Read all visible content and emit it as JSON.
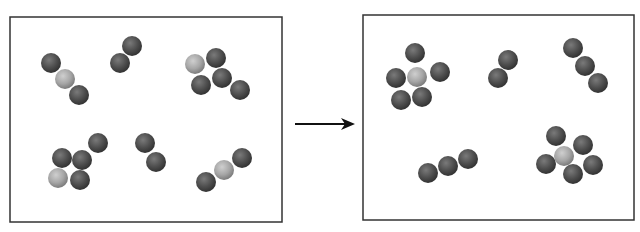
{
  "diagram": {
    "colors": {
      "background": "#ffffff",
      "border": "#333333",
      "dark_atom": "#4a4a4a",
      "light_atom": "#a8a8a8",
      "arrow": "#111111"
    },
    "atom_radius": 10,
    "panels": [
      {
        "name": "reactants",
        "box": {
          "x": 10,
          "y": 17,
          "w": 272,
          "h": 205
        },
        "molecules": [
          {
            "name": "molecule-ABA",
            "atoms": [
              {
                "x": 51,
                "y": 63,
                "type": "dark"
              },
              {
                "x": 65,
                "y": 79,
                "type": "light"
              },
              {
                "x": 79,
                "y": 95,
                "type": "dark"
              }
            ]
          },
          {
            "name": "molecule-A2-top",
            "atoms": [
              {
                "x": 132,
                "y": 46,
                "type": "dark"
              },
              {
                "x": 120,
                "y": 63,
                "type": "dark"
              }
            ]
          },
          {
            "name": "molecule-cluster-top-right",
            "atoms": [
              {
                "x": 195,
                "y": 64,
                "type": "light"
              },
              {
                "x": 216,
                "y": 58,
                "type": "dark"
              },
              {
                "x": 201,
                "y": 85,
                "type": "dark"
              },
              {
                "x": 222,
                "y": 78,
                "type": "dark"
              },
              {
                "x": 240,
                "y": 90,
                "type": "dark"
              }
            ]
          },
          {
            "name": "molecule-cluster-bottom-left",
            "atoms": [
              {
                "x": 98,
                "y": 143,
                "type": "dark"
              },
              {
                "x": 62,
                "y": 158,
                "type": "dark"
              },
              {
                "x": 82,
                "y": 160,
                "type": "dark"
              },
              {
                "x": 58,
                "y": 178,
                "type": "light"
              },
              {
                "x": 80,
                "y": 180,
                "type": "dark"
              }
            ]
          },
          {
            "name": "molecule-A2-bottom",
            "atoms": [
              {
                "x": 145,
                "y": 143,
                "type": "dark"
              },
              {
                "x": 156,
                "y": 162,
                "type": "dark"
              }
            ]
          },
          {
            "name": "molecule-ABA-bottom",
            "atoms": [
              {
                "x": 242,
                "y": 158,
                "type": "dark"
              },
              {
                "x": 224,
                "y": 170,
                "type": "light"
              },
              {
                "x": 206,
                "y": 182,
                "type": "dark"
              }
            ]
          }
        ]
      },
      {
        "name": "products",
        "box": {
          "x": 363,
          "y": 15,
          "w": 271,
          "h": 205
        },
        "molecules": [
          {
            "name": "molecule-BA5-top-left",
            "atoms": [
              {
                "x": 415,
                "y": 53,
                "type": "dark"
              },
              {
                "x": 440,
                "y": 72,
                "type": "dark"
              },
              {
                "x": 396,
                "y": 78,
                "type": "dark"
              },
              {
                "x": 401,
                "y": 100,
                "type": "dark"
              },
              {
                "x": 422,
                "y": 97,
                "type": "dark"
              },
              {
                "x": 417,
                "y": 77,
                "type": "light"
              }
            ]
          },
          {
            "name": "molecule-A2-product",
            "atoms": [
              {
                "x": 508,
                "y": 60,
                "type": "dark"
              },
              {
                "x": 498,
                "y": 78,
                "type": "dark"
              }
            ]
          },
          {
            "name": "molecule-A3-top-right",
            "atoms": [
              {
                "x": 573,
                "y": 48,
                "type": "dark"
              },
              {
                "x": 585,
                "y": 66,
                "type": "dark"
              },
              {
                "x": 598,
                "y": 83,
                "type": "dark"
              }
            ]
          },
          {
            "name": "molecule-A3-bottom",
            "atoms": [
              {
                "x": 468,
                "y": 159,
                "type": "dark"
              },
              {
                "x": 448,
                "y": 166,
                "type": "dark"
              },
              {
                "x": 428,
                "y": 173,
                "type": "dark"
              }
            ]
          },
          {
            "name": "molecule-BA5-bottom-right",
            "atoms": [
              {
                "x": 556,
                "y": 136,
                "type": "dark"
              },
              {
                "x": 583,
                "y": 145,
                "type": "dark"
              },
              {
                "x": 546,
                "y": 164,
                "type": "dark"
              },
              {
                "x": 573,
                "y": 174,
                "type": "dark"
              },
              {
                "x": 593,
                "y": 165,
                "type": "dark"
              },
              {
                "x": 564,
                "y": 156,
                "type": "light"
              }
            ]
          }
        ]
      }
    ],
    "arrow": {
      "x1": 295,
      "y1": 124,
      "x2": 355,
      "y2": 124
    }
  }
}
